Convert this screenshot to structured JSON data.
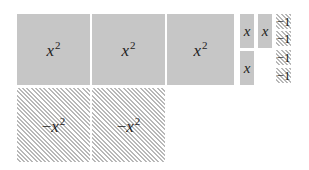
{
  "diagram": {
    "positive_x_squared": [
      {
        "label_base": "x",
        "label_exp": "2"
      },
      {
        "label_base": "x",
        "label_exp": "2"
      },
      {
        "label_base": "x",
        "label_exp": "2"
      }
    ],
    "positive_x": [
      {
        "label": "x"
      },
      {
        "label": "x"
      },
      {
        "label": "x"
      }
    ],
    "negative_ones": [
      {
        "label": "−1"
      },
      {
        "label": "−1"
      },
      {
        "label": "−1"
      },
      {
        "label": "−1"
      }
    ],
    "negative_x_squared": [
      {
        "label_sign": "−",
        "label_base": "x",
        "label_exp": "2"
      },
      {
        "label_sign": "−",
        "label_base": "x",
        "label_exp": "2"
      }
    ],
    "colors": {
      "positive_fill": "#c6c6c6",
      "negative_hatch": "#b8b8b8",
      "background": "#ffffff"
    }
  }
}
